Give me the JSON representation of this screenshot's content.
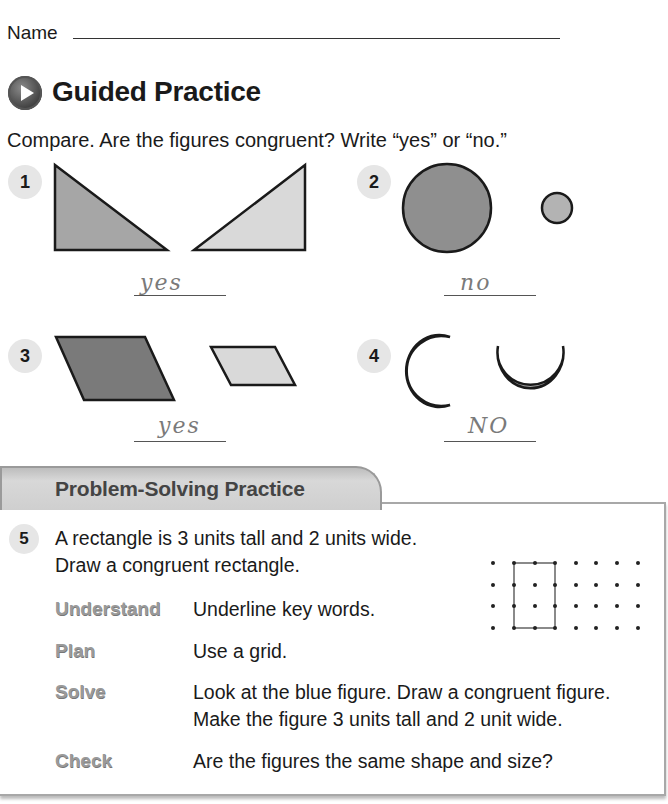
{
  "header": {
    "name_label": "Name"
  },
  "section": {
    "title": "Guided Practice",
    "icon": "play-icon",
    "instructions": "Compare. Are the figures congruent? Write “yes” or “no.”"
  },
  "exercises": [
    {
      "number": "1",
      "figures": "two right triangles (mirrored)",
      "answer": "yes"
    },
    {
      "number": "2",
      "figures": "large circle and small circle",
      "answer": "no"
    },
    {
      "number": "3",
      "figures": "large parallelogram and small parallelogram",
      "answer": "yes"
    },
    {
      "number": "4",
      "figures": "two crescent moons",
      "answer": "NO"
    }
  ],
  "problem_solving": {
    "tab_title": "Problem-Solving Practice",
    "number": "5",
    "problem_line1": "A rectangle is 3 units tall and 2 units wide.",
    "problem_line2": "Draw a congruent rectangle.",
    "steps": [
      {
        "label": "Understand",
        "text": "Underline key words."
      },
      {
        "label": "Plan",
        "text": "Use a grid."
      },
      {
        "label": "Solve",
        "text": "Look at the blue figure. Draw a congruent figure.",
        "text2": "Make the figure 3 units tall and 2 unit wide."
      },
      {
        "label": "Check",
        "text": "Are the figures the same shape and size?"
      }
    ],
    "grid": {
      "rows": 4,
      "cols": 8,
      "rectangle": {
        "col_start": 1,
        "col_end": 3,
        "row_start": 0,
        "row_end": 3
      }
    }
  }
}
